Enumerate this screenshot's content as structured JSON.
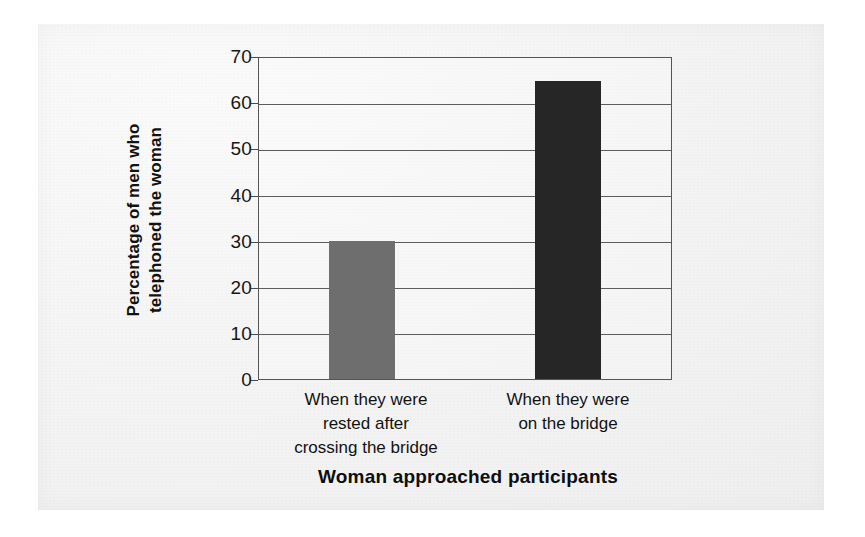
{
  "chart_data": {
    "type": "bar",
    "title": "",
    "xlabel": "Woman approached participants",
    "ylabel": "Percentage of men who telephoned the woman",
    "ylabel_lines": [
      "Percentage of men who",
      "telephoned the woman"
    ],
    "categories": [
      "When they were rested after crossing the bridge",
      "When they were on the bridge"
    ],
    "category_lines": [
      [
        "When they were",
        "rested after",
        "crossing the bridge"
      ],
      [
        "When they were",
        "on the bridge"
      ]
    ],
    "values": [
      30,
      65
    ],
    "ylim": [
      0,
      70
    ],
    "yticks": [
      70,
      60,
      50,
      40,
      30,
      20,
      10,
      0
    ],
    "ytick_labels": [
      "70",
      "60",
      "50",
      "40",
      "30",
      "20",
      "10",
      "0"
    ],
    "grid": true,
    "grid_axis": "y",
    "legend": "none",
    "bar_colors": [
      "#6e6e6e",
      "#262626"
    ],
    "bar_width_px": 66,
    "plot_border_color": "#555555",
    "gridline_color": "#5d5d5d",
    "background": "#f2f2f2"
  }
}
